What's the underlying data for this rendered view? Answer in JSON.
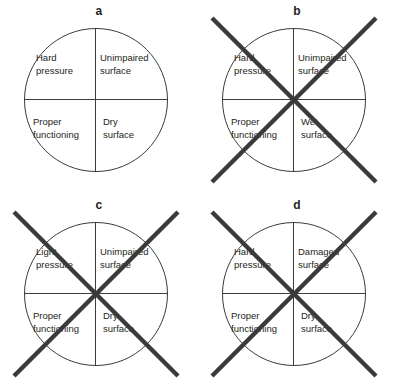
{
  "figure": {
    "background_color": "#ffffff",
    "line_color": "#3c3c3c",
    "cross_color": "#3a3a3a",
    "text_color": "#231f20"
  },
  "panels": [
    {
      "id": "a",
      "label": "a",
      "crossed_out": false,
      "quadrants": {
        "top_left": "Hard\npressure",
        "top_right": "Unimpaired\nsurface",
        "bottom_left": "Proper\nfunctioning",
        "bottom_right": "Dry\nsurface"
      }
    },
    {
      "id": "b",
      "label": "b",
      "crossed_out": true,
      "quadrants": {
        "top_left": "Hard\npressure",
        "top_right": "Unimpaired\nsurface",
        "bottom_left": "Proper\nfunctioning",
        "bottom_right": "Wet\nsurface"
      }
    },
    {
      "id": "c",
      "label": "c",
      "crossed_out": true,
      "quadrants": {
        "top_left": "Light\npressure",
        "top_right": "Unimpaired\nsurface",
        "bottom_left": "Proper\nfunctioning",
        "bottom_right": "Dry\nsurface"
      }
    },
    {
      "id": "d",
      "label": "d",
      "crossed_out": true,
      "quadrants": {
        "top_left": "Hard\npressure",
        "top_right": "Damaged\nsurface",
        "bottom_left": "Proper\nfunctioning",
        "bottom_right": "Dry\nsurface"
      }
    }
  ]
}
